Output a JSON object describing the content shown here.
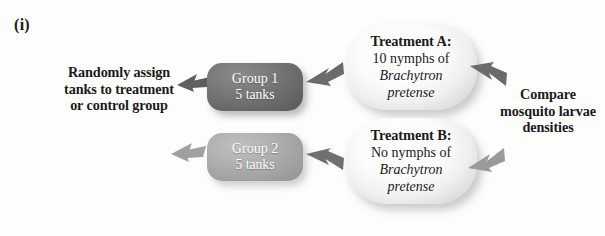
{
  "figure": {
    "panel_label": "(i)"
  },
  "flow": {
    "start": {
      "text": "Randomly assign tanks to treatment or control group"
    },
    "groups": [
      {
        "name": "Group 1",
        "tanks": "5 tanks",
        "fill_color": "#6e6e6e"
      },
      {
        "name": "Group 2",
        "tanks": "5 tanks",
        "fill_color": "#a8a8a8"
      }
    ],
    "treatments": [
      {
        "title": "Treatment A:",
        "detail": "10 nymphs of",
        "species_genus": "Brachytron",
        "species_epithet": "pretense"
      },
      {
        "title": "Treatment B:",
        "detail": "No nymphs of",
        "species_genus": "Brachytron",
        "species_epithet": "pretense"
      }
    ],
    "end": {
      "text": "Compare mosquito larvae densities"
    },
    "arrows": [
      {
        "name": "start-to-group-1",
        "color": "#5f5f5f"
      },
      {
        "name": "start-to-group-2",
        "color": "#a0a0a0"
      },
      {
        "name": "group-1-to-treatment-a",
        "color": "#6b6b6b"
      },
      {
        "name": "group-2-to-treatment-b",
        "color": "#707070"
      },
      {
        "name": "treatment-a-to-compare",
        "color": "#6b6b6b"
      },
      {
        "name": "treatment-b-to-compare",
        "color": "#9a9a9a"
      }
    ]
  }
}
